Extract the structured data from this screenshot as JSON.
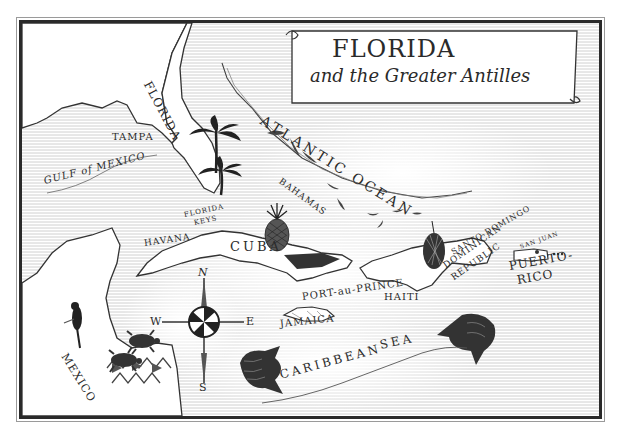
{
  "title": {
    "main": "FLORIDA",
    "subtitle": "and the Greater Antilles"
  },
  "regions": {
    "florida": "FLORIDA",
    "mexico": "MEXICO",
    "cuba": "CUBA",
    "jamaica": "JAMAICA",
    "haiti": "HAITI",
    "dominican_republic_line1": "DOMINICAN",
    "dominican_republic_line2": "REPUBLIC",
    "puerto_rico_line1": "PUERTO-",
    "puerto_rico_line2": "RICO",
    "bahamas": "BAHAMAS",
    "florida_keys_line1": "FLORIDA",
    "florida_keys_line2": "KEYS"
  },
  "cities": {
    "tampa": "TAMPA",
    "havana": "HAVANA",
    "port_au_prince": "PORT-au-PRINCE",
    "santo_domingo": "SANTO DOMINGO",
    "san_juan": "SAN JUAN"
  },
  "waters": {
    "gulf": "GULF of MEXICO",
    "atlantic": "ATLANTIC OCEAN",
    "caribbean_1": "CARIBBEAN",
    "caribbean_2": "SEA"
  },
  "compass": {
    "north": "N",
    "south": "S",
    "east": "E",
    "west": "W"
  },
  "colors": {
    "ink": "#2a2a2a",
    "paper": "#ffffff",
    "hatching": "#c8c8c8"
  }
}
